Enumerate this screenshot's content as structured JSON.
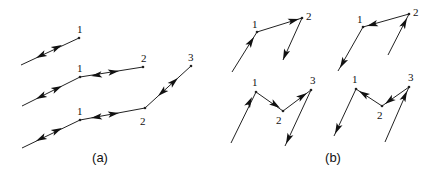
{
  "captions": [
    {
      "text": "(a)",
      "x": 100,
      "y": 162
    },
    {
      "text": "(b)",
      "x": 333,
      "y": 162
    }
  ],
  "panel_a": {
    "rows": [
      {
        "points": [
          {
            "x": 21,
            "y": 65
          },
          {
            "x": 79,
            "y": 38
          }
        ],
        "labels": [
          {
            "text": "1",
            "x": 77,
            "y": 33
          }
        ],
        "arrows": [
          {
            "x1": 48,
            "y1": 52,
            "x2": 36,
            "y2": 58
          },
          {
            "x1": 50,
            "y1": 51,
            "x2": 62,
            "y2": 45
          }
        ]
      },
      {
        "points": [
          {
            "x": 22,
            "y": 106
          },
          {
            "x": 80,
            "y": 77
          },
          {
            "x": 143,
            "y": 67
          }
        ],
        "labels": [
          {
            "text": "1",
            "x": 77,
            "y": 72
          },
          {
            "text": "2",
            "x": 141,
            "y": 62
          }
        ],
        "arrows": [
          {
            "x1": 48,
            "y1": 93,
            "x2": 36,
            "y2": 99
          },
          {
            "x1": 50,
            "y1": 92,
            "x2": 62,
            "y2": 86
          },
          {
            "x1": 104,
            "y1": 74,
            "x2": 91,
            "y2": 76
          },
          {
            "x1": 106,
            "y1": 73,
            "x2": 119,
            "y2": 71
          }
        ]
      },
      {
        "points": [
          {
            "x": 22,
            "y": 148
          },
          {
            "x": 80,
            "y": 120
          },
          {
            "x": 145,
            "y": 108
          },
          {
            "x": 191,
            "y": 66
          }
        ],
        "labels": [
          {
            "text": "1",
            "x": 77,
            "y": 115
          },
          {
            "text": "2",
            "x": 140,
            "y": 125
          },
          {
            "text": "3",
            "x": 188,
            "y": 61
          }
        ],
        "arrows": [
          {
            "x1": 48,
            "y1": 135,
            "x2": 36,
            "y2": 141
          },
          {
            "x1": 50,
            "y1": 134,
            "x2": 62,
            "y2": 128
          },
          {
            "x1": 104,
            "y1": 116,
            "x2": 91,
            "y2": 118
          },
          {
            "x1": 106,
            "y1": 115,
            "x2": 119,
            "y2": 113
          },
          {
            "x1": 167,
            "y1": 88,
            "x2": 158,
            "y2": 96
          },
          {
            "x1": 169,
            "y1": 86,
            "x2": 178,
            "y2": 78
          }
        ]
      }
    ]
  },
  "panel_b": {
    "diagrams": [
      {
        "points": [
          {
            "x": 232,
            "y": 72
          },
          {
            "x": 257,
            "y": 32
          },
          {
            "x": 302,
            "y": 18
          },
          {
            "x": 283,
            "y": 60
          }
        ],
        "labels": [
          {
            "text": "1",
            "x": 252,
            "y": 28
          },
          {
            "text": "2",
            "x": 306,
            "y": 20
          }
        ],
        "arrows": [
          {
            "x1": 247,
            "y1": 48,
            "x2": 254,
            "y2": 37
          },
          {
            "x1": 288,
            "y1": 22,
            "x2": 299,
            "y2": 19
          },
          {
            "x1": 287,
            "y1": 50,
            "x2": 283,
            "y2": 60
          }
        ],
        "dots": [
          {
            "x": 257,
            "y": 32
          },
          {
            "x": 302,
            "y": 18
          }
        ]
      },
      {
        "points": [
          {
            "x": 338,
            "y": 71
          },
          {
            "x": 363,
            "y": 27
          },
          {
            "x": 409,
            "y": 14
          },
          {
            "x": 388,
            "y": 55
          }
        ],
        "labels": [
          {
            "text": "1",
            "x": 357,
            "y": 23
          },
          {
            "text": "2",
            "x": 413,
            "y": 16
          }
        ],
        "arrows": [
          {
            "x1": 346,
            "y1": 57,
            "x2": 340,
            "y2": 68
          },
          {
            "x1": 378,
            "y1": 23,
            "x2": 367,
            "y2": 26
          },
          {
            "x1": 402,
            "y1": 28,
            "x2": 407,
            "y2": 18
          }
        ],
        "dots": [
          {
            "x": 363,
            "y": 27
          },
          {
            "x": 409,
            "y": 14
          }
        ]
      },
      {
        "points": [
          {
            "x": 231,
            "y": 143
          },
          {
            "x": 256,
            "y": 92
          },
          {
            "x": 283,
            "y": 111
          },
          {
            "x": 311,
            "y": 90
          },
          {
            "x": 285,
            "y": 146
          }
        ],
        "labels": [
          {
            "text": "1",
            "x": 252,
            "y": 86
          },
          {
            "text": "2",
            "x": 276,
            "y": 124
          },
          {
            "text": "3",
            "x": 310,
            "y": 84
          }
        ],
        "arrows": [
          {
            "x1": 245,
            "y1": 111,
            "x2": 252,
            "y2": 97
          },
          {
            "x1": 271,
            "y1": 102,
            "x2": 280,
            "y2": 108
          },
          {
            "x1": 298,
            "y1": 99,
            "x2": 307,
            "y2": 93
          },
          {
            "x1": 290,
            "y1": 135,
            "x2": 286,
            "y2": 144
          }
        ],
        "dots": [
          {
            "x": 256,
            "y": 92
          },
          {
            "x": 283,
            "y": 111
          },
          {
            "x": 311,
            "y": 90
          }
        ]
      },
      {
        "points": [
          {
            "x": 334,
            "y": 136
          },
          {
            "x": 356,
            "y": 89
          },
          {
            "x": 382,
            "y": 106
          },
          {
            "x": 409,
            "y": 87
          },
          {
            "x": 385,
            "y": 142
          }
        ],
        "labels": [
          {
            "text": "1",
            "x": 352,
            "y": 83
          },
          {
            "text": "2",
            "x": 377,
            "y": 119
          },
          {
            "text": "3",
            "x": 408,
            "y": 81
          }
        ],
        "arrows": [
          {
            "x1": 341,
            "y1": 121,
            "x2": 335,
            "y2": 134
          },
          {
            "x1": 367,
            "y1": 96,
            "x2": 359,
            "y2": 91
          },
          {
            "x1": 393,
            "y1": 98,
            "x2": 385,
            "y2": 104
          },
          {
            "x1": 402,
            "y1": 102,
            "x2": 407,
            "y2": 91
          }
        ],
        "dots": [
          {
            "x": 356,
            "y": 89
          },
          {
            "x": 382,
            "y": 106
          },
          {
            "x": 409,
            "y": 87
          }
        ]
      }
    ]
  },
  "colors": {
    "stroke": "#222222",
    "text": "#111111",
    "background": "#ffffff"
  }
}
